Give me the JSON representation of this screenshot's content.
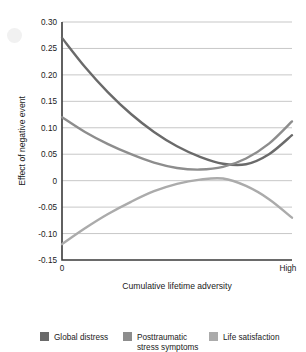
{
  "chart_data": {
    "type": "line",
    "title": "",
    "xlabel": "Cumulative lifetime adversity",
    "ylabel": "Effect of negative event",
    "xlim": [
      0,
      1
    ],
    "ylim": [
      -0.15,
      0.3
    ],
    "grid": true,
    "legend_position": "bottom",
    "xticks": [
      {
        "value": 0,
        "label": "0"
      },
      {
        "value": 1,
        "label": "High"
      }
    ],
    "yticks": [
      {
        "value": 0.3,
        "label": "0.30"
      },
      {
        "value": 0.25,
        "label": "0.25"
      },
      {
        "value": 0.2,
        "label": "0.20"
      },
      {
        "value": 0.15,
        "label": "0.15"
      },
      {
        "value": 0.1,
        "label": "0.10"
      },
      {
        "value": 0.05,
        "label": "0.05"
      },
      {
        "value": 0.0,
        "label": "0"
      },
      {
        "value": -0.05,
        "label": "-0.05"
      },
      {
        "value": -0.1,
        "label": "-0.10"
      },
      {
        "value": -0.15,
        "label": "-0.15"
      }
    ],
    "x": [
      0,
      0.1,
      0.2,
      0.3,
      0.4,
      0.5,
      0.6,
      0.7,
      0.8,
      0.9,
      1.0
    ],
    "series": [
      {
        "name": "Global distress",
        "color": "#6a6a6a",
        "values": [
          0.27,
          0.215,
          0.167,
          0.126,
          0.092,
          0.065,
          0.045,
          0.032,
          0.031,
          0.05,
          0.086
        ]
      },
      {
        "name": "Posttraumatic stress symptoms",
        "color": "#8d8d8d",
        "values": [
          0.12,
          0.092,
          0.069,
          0.05,
          0.034,
          0.024,
          0.021,
          0.026,
          0.042,
          0.07,
          0.112
        ]
      },
      {
        "name": "Life satisfaction",
        "color": "#ababab",
        "values": [
          -0.12,
          -0.09,
          -0.063,
          -0.04,
          -0.02,
          -0.006,
          0.002,
          0.004,
          -0.01,
          -0.035,
          -0.07
        ]
      }
    ]
  },
  "legend": {
    "items": [
      {
        "label": "Global distress",
        "color": "#6a6a6a"
      },
      {
        "label": "Posttraumatic",
        "label2": "stress symptoms",
        "color": "#8d8d8d"
      },
      {
        "label": "Life satisfaction",
        "color": "#ababab"
      }
    ]
  }
}
